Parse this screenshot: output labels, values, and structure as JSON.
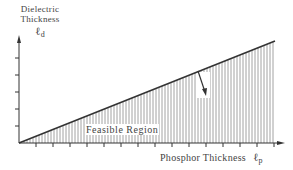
{
  "y_axis": {
    "label_line1": "Dielectric",
    "label_line2": "Thickness",
    "symbol": "ℓ",
    "subscript": "d"
  },
  "x_axis": {
    "label": "Phosphor Thickness",
    "symbol": "ℓ",
    "subscript": "p"
  },
  "region_label": "Feasible Region",
  "colors": {
    "line": "#333333",
    "hatch": "#888888",
    "axis": "#333333"
  }
}
